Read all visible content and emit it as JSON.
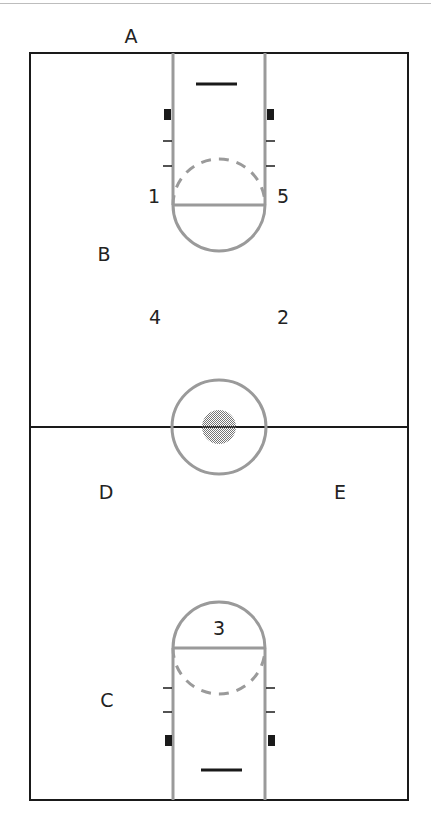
{
  "diagram": {
    "type": "basketball-court-positions",
    "colors": {
      "line": "#1a1a1a",
      "paint": "#9a9a9a",
      "center_dot": "#8a8a8a"
    },
    "court_labels": [
      {
        "id": "A",
        "text": "A",
        "x": 131,
        "y": 36
      },
      {
        "id": "B",
        "text": "B",
        "x": 104,
        "y": 254
      },
      {
        "id": "C",
        "text": "C",
        "x": 107,
        "y": 700
      },
      {
        "id": "D",
        "text": "D",
        "x": 106,
        "y": 492
      },
      {
        "id": "E",
        "text": "E",
        "x": 340,
        "y": 492
      }
    ],
    "position_numbers": [
      {
        "id": "1",
        "text": "1",
        "x": 154,
        "y": 196
      },
      {
        "id": "2",
        "text": "2",
        "x": 283,
        "y": 317
      },
      {
        "id": "3",
        "text": "3",
        "x": 219,
        "y": 628
      },
      {
        "id": "4",
        "text": "4",
        "x": 155,
        "y": 317
      },
      {
        "id": "5",
        "text": "5",
        "x": 283,
        "y": 196
      }
    ]
  }
}
